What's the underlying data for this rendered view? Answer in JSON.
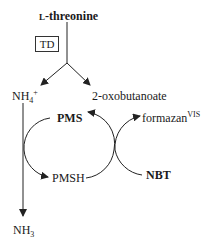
{
  "title": {
    "prefix": "L",
    "main": "-threonine"
  },
  "enzyme": {
    "label": "TD"
  },
  "products": {
    "ammonium": {
      "base": "NH",
      "sub": "4",
      "sup": "+"
    },
    "ketoacid": "2-oxobutanoate",
    "ammonia": {
      "base": "NH",
      "sub": "3"
    }
  },
  "cycle": {
    "pms": "PMS",
    "pmsh": "PMSH",
    "nbt": "NBT",
    "formazan": {
      "base": "formazan",
      "sup": "VIS"
    }
  },
  "colors": {
    "line": "#222222",
    "text": "#1a1a1a"
  }
}
